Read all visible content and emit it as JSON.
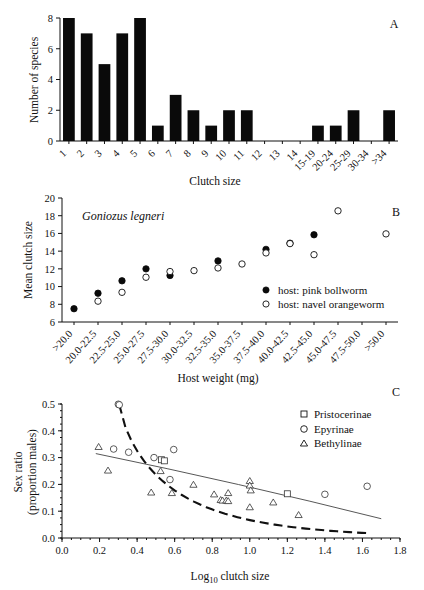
{
  "figure": {
    "panels": [
      "A",
      "B",
      "C"
    ]
  },
  "panelA": {
    "label": "A",
    "chart_data": {
      "type": "bar",
      "title": "",
      "xlabel": "Clutch size",
      "ylabel": "Number of species",
      "categories": [
        "1",
        "2",
        "3",
        "4",
        "5",
        "6",
        "7",
        "8",
        "9",
        "10",
        "11",
        "12",
        "13",
        "14",
        "15-19",
        "20-24",
        "25-29",
        "30-34",
        ">34"
      ],
      "values": [
        8,
        7,
        5,
        7,
        8,
        1,
        3,
        2,
        1,
        2,
        2,
        0,
        0,
        0,
        1,
        1,
        2,
        0,
        2
      ],
      "ylim": [
        0,
        8
      ],
      "yticks": [
        0,
        2,
        4,
        6,
        8
      ],
      "grid": false,
      "legend": "none"
    }
  },
  "panelB": {
    "label": "B",
    "annotation": "Goniozus legneri",
    "chart_data": {
      "type": "scatter",
      "title": "",
      "xlabel": "Host weight (mg)",
      "ylabel": "Mean clutch size",
      "categories": [
        ">20.0",
        "20.0-22.5",
        "22.5-25.0",
        "25.0-27.5",
        "27.5-30.0",
        "30.0-32.5",
        "32.5-35.0",
        "35.0-37.5",
        "37.5-40.0",
        "40.0-42.5",
        "42.5-45.0",
        "45.0-47.5",
        "47.5-50.0",
        ">50.0"
      ],
      "ylim": [
        6,
        20
      ],
      "yticks": [
        6,
        8,
        10,
        12,
        14,
        16,
        18,
        20
      ],
      "grid": false,
      "legend_position": "lower-right",
      "series": [
        {
          "name": "host: pink bollworm",
          "marker": "filled-circle",
          "values": [
            7.5,
            9.25,
            10.65,
            12.0,
            11.25,
            null,
            12.9,
            null,
            14.2,
            14.9,
            15.85,
            null,
            null,
            null
          ]
        },
        {
          "name": "host: navel orangeworm",
          "marker": "open-circle",
          "values": [
            null,
            8.35,
            9.35,
            11.05,
            11.7,
            11.8,
            12.1,
            12.55,
            13.8,
            14.85,
            13.6,
            18.55,
            null,
            15.95
          ]
        }
      ]
    }
  },
  "panelC": {
    "label": "C",
    "chart_data": {
      "type": "scatter",
      "title": "",
      "xlabel": "Log10 clutch size",
      "xlabel_base": "Log",
      "xlabel_sub": "10",
      "xlabel_rest": " clutch size",
      "ylabel": "Sex ratio (proportion males)",
      "ylabel_line1": "Sex ratio",
      "ylabel_line2": "(proportion males)",
      "xlim": [
        0.0,
        1.8
      ],
      "ylim": [
        0.0,
        0.5
      ],
      "xticks": [
        0.0,
        0.2,
        0.4,
        0.6,
        0.8,
        1.0,
        1.2,
        1.4,
        1.6,
        1.8
      ],
      "yticks": [
        0.0,
        0.1,
        0.2,
        0.3,
        0.4,
        0.5
      ],
      "grid": false,
      "legend_position": "upper-right",
      "series": [
        {
          "name": "Pristocerinae",
          "marker": "open-square",
          "points": [
            [
              0.53,
              0.292
            ],
            [
              0.545,
              0.288
            ],
            [
              1.2,
              0.165
            ]
          ]
        },
        {
          "name": "Epyrinae",
          "marker": "open-circle",
          "points": [
            [
              0.3,
              0.499
            ],
            [
              0.305,
              0.497
            ],
            [
              0.275,
              0.332
            ],
            [
              0.355,
              0.32
            ],
            [
              0.49,
              0.3
            ],
            [
              0.595,
              0.33
            ],
            [
              0.575,
              0.218
            ],
            [
              1.4,
              0.163
            ],
            [
              1.625,
              0.193
            ]
          ]
        },
        {
          "name": "Bethylinae",
          "marker": "open-triangle",
          "points": [
            [
              0.195,
              0.34
            ],
            [
              0.245,
              0.252
            ],
            [
              0.475,
              0.17
            ],
            [
              0.525,
              0.25
            ],
            [
              0.585,
              0.168
            ],
            [
              0.7,
              0.199
            ],
            [
              0.81,
              0.163
            ],
            [
              0.845,
              0.142
            ],
            [
              0.855,
              0.14
            ],
            [
              0.875,
              0.14
            ],
            [
              0.885,
              0.168
            ],
            [
              0.885,
              0.138
            ],
            [
              1.0,
              0.213
            ],
            [
              1.0,
              0.196
            ],
            [
              1.005,
              0.178
            ],
            [
              1.0,
              0.115
            ],
            [
              1.125,
              0.133
            ],
            [
              1.26,
              0.086
            ]
          ]
        }
      ],
      "fits": [
        {
          "name": "thin-solid-fit",
          "style": "solid",
          "from": [
            0.18,
            0.315
          ],
          "to": [
            1.7,
            0.072
          ]
        },
        {
          "name": "thick-dashed-fit",
          "style": "dashed",
          "from": [
            0.305,
            0.497
          ],
          "to": [
            1.63,
            0.018
          ]
        }
      ]
    }
  }
}
